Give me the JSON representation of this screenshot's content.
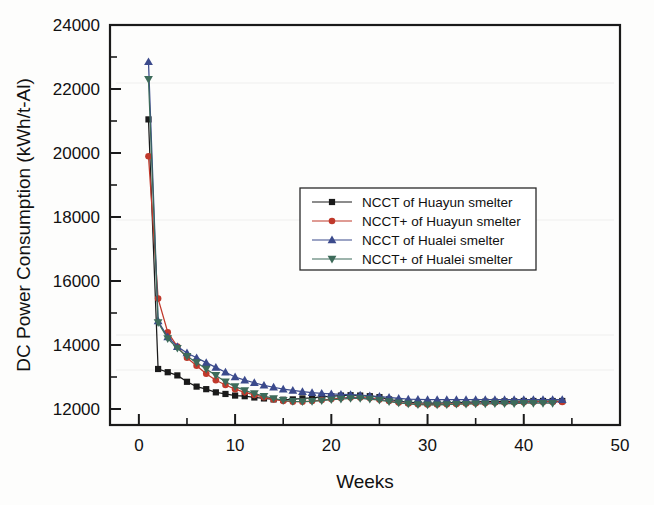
{
  "chart_data": {
    "type": "line",
    "title": "",
    "xlabel": "Weeks",
    "ylabel": "DC Power Consumption (kWh/t-Al)",
    "xlim": [
      -3,
      50
    ],
    "ylim": [
      11500,
      24000
    ],
    "xticks": [
      0,
      10,
      20,
      30,
      40,
      50
    ],
    "yticks": [
      12000,
      14000,
      16000,
      18000,
      20000,
      22000,
      24000
    ],
    "xticklabels": [
      "0",
      "10",
      "20",
      "30",
      "40",
      "50"
    ],
    "yticklabels": [
      "12000",
      "14000",
      "16000",
      "18000",
      "20000",
      "22000",
      "24000"
    ],
    "x_minor_interval": 5,
    "y_minor_interval": 1000,
    "grid": false,
    "legend_position": "center-right-upper",
    "series": [
      {
        "name": "NCCT   of Huayun smelter",
        "color": "#1a1a1a",
        "marker": "square",
        "x": [
          1,
          2,
          3,
          4,
          5,
          6,
          7,
          8,
          9,
          10,
          11,
          12,
          13,
          14,
          15,
          16,
          17,
          18,
          19,
          20,
          21,
          22,
          23,
          24,
          25,
          26,
          27,
          28,
          29,
          30,
          31,
          32,
          33,
          34,
          35,
          36,
          37,
          38,
          39,
          40,
          41,
          42,
          43,
          44
        ],
        "y": [
          21050,
          13250,
          13150,
          13050,
          12850,
          12700,
          12620,
          12520,
          12470,
          12420,
          12400,
          12360,
          12330,
          12300,
          12290,
          12300,
          12330,
          12350,
          12380,
          12400,
          12420,
          12430,
          12420,
          12400,
          12370,
          12300,
          12250,
          12210,
          12190,
          12180,
          12180,
          12190,
          12200,
          12210,
          12220,
          12230,
          12230,
          12240,
          12240,
          12250,
          12250,
          12250,
          12250,
          12250
        ]
      },
      {
        "name": "NCCT+ of Huayun smelter",
        "color": "#c0392b",
        "marker": "circle",
        "x": [
          1,
          2,
          3,
          4,
          5,
          6,
          7,
          8,
          9,
          10,
          11,
          12,
          13,
          14,
          15,
          16,
          17,
          18,
          19,
          20,
          21,
          22,
          23,
          24,
          25,
          26,
          27,
          28,
          29,
          30,
          31,
          32,
          33,
          34,
          35,
          36,
          37,
          38,
          39,
          40,
          41,
          42,
          43,
          44
        ],
        "y": [
          19900,
          15450,
          14400,
          13950,
          13600,
          13350,
          13100,
          12900,
          12750,
          12620,
          12520,
          12440,
          12370,
          12300,
          12250,
          12230,
          12230,
          12250,
          12280,
          12310,
          12340,
          12360,
          12360,
          12340,
          12300,
          12250,
          12200,
          12170,
          12150,
          12140,
          12140,
          12150,
          12160,
          12170,
          12180,
          12190,
          12200,
          12200,
          12210,
          12210,
          12220,
          12220,
          12220,
          12220
        ]
      },
      {
        "name": "NCCT   of Hualei smelter",
        "color": "#3b4a8c",
        "marker": "triangle-up",
        "x": [
          1,
          2,
          3,
          4,
          5,
          6,
          7,
          8,
          9,
          10,
          11,
          12,
          13,
          14,
          15,
          16,
          17,
          18,
          19,
          20,
          21,
          22,
          23,
          24,
          25,
          26,
          27,
          28,
          29,
          30,
          31,
          32,
          33,
          34,
          35,
          36,
          37,
          38,
          39,
          40,
          41,
          42,
          43,
          44
        ],
        "y": [
          22850,
          14750,
          14250,
          13950,
          13750,
          13600,
          13450,
          13300,
          13150,
          13000,
          12900,
          12820,
          12740,
          12680,
          12620,
          12580,
          12540,
          12510,
          12490,
          12470,
          12460,
          12450,
          12430,
          12410,
          12390,
          12360,
          12330,
          12310,
          12300,
          12290,
          12290,
          12290,
          12290,
          12290,
          12290,
          12290,
          12290,
          12290,
          12290,
          12290,
          12290,
          12290,
          12290,
          12290
        ]
      },
      {
        "name": "NCCT+ of Hualei smelter",
        "color": "#3d6b5a",
        "marker": "triangle-down",
        "x": [
          1,
          2,
          3,
          4,
          5,
          6,
          7,
          8,
          9,
          10,
          11,
          12,
          13,
          14,
          15,
          16,
          17,
          18,
          19,
          20,
          21,
          22,
          23,
          24,
          25,
          26,
          27,
          28,
          29,
          30,
          31,
          32,
          33,
          34,
          35,
          36,
          37,
          38,
          39,
          40,
          41,
          42,
          43
        ],
        "y": [
          22300,
          14700,
          14200,
          13900,
          13650,
          13450,
          13250,
          13050,
          12850,
          12700,
          12580,
          12480,
          12400,
          12330,
          12270,
          12240,
          12230,
          12240,
          12260,
          12290,
          12310,
          12330,
          12330,
          12310,
          12280,
          12230,
          12190,
          12160,
          12140,
          12130,
          12130,
          12140,
          12150,
          12150,
          12160,
          12160,
          12170,
          12170,
          12170,
          12180,
          12180,
          12180,
          12180
        ]
      }
    ]
  },
  "legend": {
    "items": [
      {
        "label": "NCCT   of Huayun smelter"
      },
      {
        "label": "NCCT+ of Huayun smelter"
      },
      {
        "label": "NCCT   of Hualei smelter"
      },
      {
        "label": "NCCT+ of Hualei smelter"
      }
    ]
  }
}
